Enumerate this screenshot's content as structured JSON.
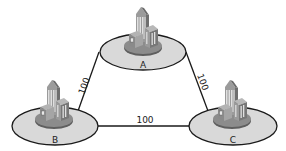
{
  "diagram": {
    "type": "network-triangle",
    "nodes": [
      {
        "id": "A",
        "label": "A",
        "icon": "city-buildings-icon",
        "cx": 143,
        "cy": 52
      },
      {
        "id": "B",
        "label": "B",
        "icon": "city-buildings-icon",
        "cx": 55,
        "cy": 126
      },
      {
        "id": "C",
        "label": "C",
        "icon": "city-buildings-icon",
        "cx": 233,
        "cy": 126
      }
    ],
    "edges": [
      {
        "from": "A",
        "to": "B",
        "label": "100"
      },
      {
        "from": "A",
        "to": "C",
        "label": "100"
      },
      {
        "from": "B",
        "to": "C",
        "label": "100"
      }
    ],
    "colors": {
      "disc_fill": "#d9d9d9",
      "outline": "#1a1a1a",
      "building": "#8a8a8a"
    }
  }
}
